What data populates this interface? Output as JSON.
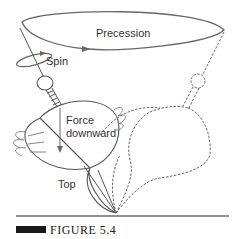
{
  "figure": {
    "caption": "FIGURE 5.4",
    "labels": {
      "precession": "Precession",
      "spin": "Spin",
      "force_line1": "Force",
      "force_line2": "downward",
      "top": "Top"
    },
    "colors": {
      "stroke": "#555555",
      "caption_bar": "#1a1a1a",
      "text": "#333333"
    }
  }
}
